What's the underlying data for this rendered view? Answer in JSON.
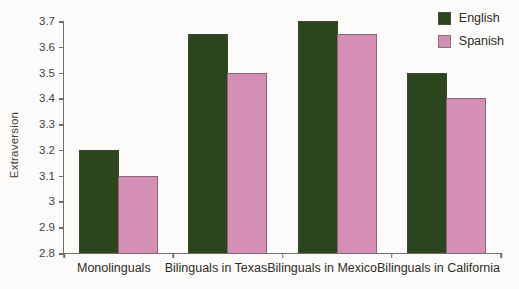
{
  "figure": {
    "background": "#fcfbf9"
  },
  "chart_data": {
    "type": "bar",
    "title": "",
    "xlabel": "",
    "ylabel": "Extraversion",
    "categories": [
      "Monolinguals",
      "Bilinguals in Texas",
      "Bilinguals in Mexico",
      "Bilinguals in California"
    ],
    "series": [
      {
        "name": "English",
        "color": "#2b461d",
        "values": [
          3.2,
          3.65,
          3.7,
          3.5
        ]
      },
      {
        "name": "Spanish",
        "color": "#d58fb6",
        "values": [
          3.1,
          3.5,
          3.65,
          3.4
        ]
      }
    ],
    "ylim": [
      2.8,
      3.7
    ],
    "yticks": [
      {
        "value": 3.7,
        "label": "3.7"
      },
      {
        "value": 3.6,
        "label": "3.6"
      },
      {
        "value": 3.5,
        "label": "3.5"
      },
      {
        "value": 3.4,
        "label": "3.4"
      },
      {
        "value": 3.3,
        "label": "3.3"
      },
      {
        "value": 3.2,
        "label": "3.2"
      },
      {
        "value": 3.1,
        "label": "3.1"
      },
      {
        "value": 3.0,
        "label": "3"
      },
      {
        "value": 2.9,
        "label": "2.9"
      },
      {
        "value": 2.8,
        "label": "2.8"
      }
    ],
    "grid": false,
    "legend_position": "top-right"
  },
  "colors": {
    "axis": "#6f6f6d",
    "tick_text": "#45423c",
    "category_text": "#2e2c28",
    "bar_border": "#4b483e"
  }
}
